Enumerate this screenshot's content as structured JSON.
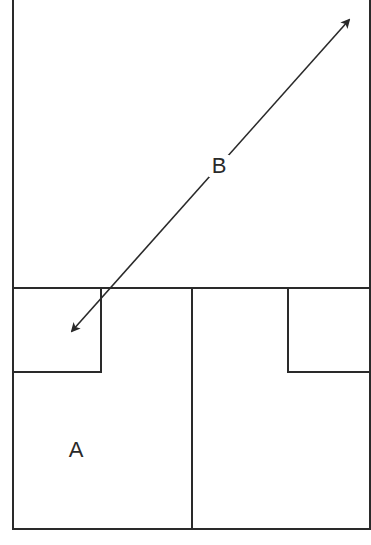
{
  "diagram": {
    "type": "floor-plan-schematic",
    "labels": {
      "a": "A",
      "b": "B"
    },
    "colors": {
      "stroke": "#2a2a2a",
      "background": "#ffffff"
    },
    "regions": [
      {
        "id": "top-room",
        "desc": "large upper rectangle"
      },
      {
        "id": "small-box-left",
        "desc": "small square at top-left of lower section"
      },
      {
        "id": "room-a",
        "desc": "lower-left room labeled A"
      },
      {
        "id": "room-right",
        "desc": "lower-right room"
      },
      {
        "id": "notch-right",
        "desc": "small rectangle at top-right of lower-right room"
      }
    ],
    "arrow": {
      "label": "B",
      "style": "double-headed",
      "from": [
        72,
        331
      ],
      "to": [
        349,
        20
      ]
    }
  }
}
